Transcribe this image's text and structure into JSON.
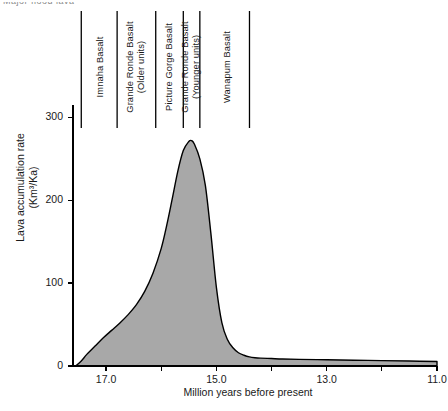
{
  "figure": {
    "clipped_header_text": "Major flood lava",
    "fill_color": "#a8a8a8",
    "line_color": "#000000"
  },
  "chart_data": {
    "type": "area",
    "title": "",
    "xlabel": "Million years before present",
    "ylabel": "Lava accumulation rate\n(Km³/Ka)",
    "xlim": [
      17.6,
      11.0
    ],
    "ylim": [
      0,
      315
    ],
    "x_reversed": true,
    "grid": false,
    "legend": "none",
    "xticks": [
      17.0,
      15.0,
      13.0,
      11.0
    ],
    "xtick_labels": [
      "17.0",
      "15.0",
      "13.0",
      "11.0"
    ],
    "xminor_ticks": [
      16.0,
      14.0,
      12.0
    ],
    "yticks": [
      0,
      100,
      200,
      300
    ],
    "ytick_labels": [
      "0",
      "100",
      "200",
      "300"
    ],
    "x": [
      17.55,
      17.45,
      17.35,
      17.2,
      17.05,
      16.9,
      16.75,
      16.6,
      16.45,
      16.3,
      16.15,
      16.0,
      15.9,
      15.8,
      15.7,
      15.6,
      15.5,
      15.45,
      15.4,
      15.3,
      15.2,
      15.1,
      15.0,
      14.9,
      14.8,
      14.7,
      14.6,
      14.5,
      14.4,
      14.3,
      14.2,
      14.0,
      13.8,
      13.5,
      13.0,
      12.5,
      12.0,
      11.5,
      11.0
    ],
    "y": [
      0,
      6,
      14,
      24,
      34,
      43,
      52,
      62,
      74,
      90,
      112,
      142,
      170,
      202,
      235,
      260,
      271,
      272,
      268,
      250,
      218,
      160,
      95,
      52,
      32,
      22,
      16,
      13,
      11,
      10,
      9.5,
      9,
      8.5,
      8,
      7.5,
      7,
      6.5,
      6,
      5.5
    ],
    "peak": {
      "x": 15.45,
      "y": 272
    },
    "annotations": [
      {
        "label": "Imnaha Basalt",
        "x_center": 17.1
      },
      {
        "label": "Grande Ronde Basalt\n(Older units)",
        "x_center": 16.45
      },
      {
        "label": "Picture Gorge Basalt",
        "x_center": 15.85
      },
      {
        "label": "Grande Ronde Basalt\n(Younger units)",
        "x_center": 15.45
      },
      {
        "label": "Wanapum Basalt",
        "x_center": 14.8
      }
    ],
    "divider_lines_x": [
      17.45,
      16.8,
      16.1,
      15.6,
      15.3,
      14.4
    ]
  }
}
